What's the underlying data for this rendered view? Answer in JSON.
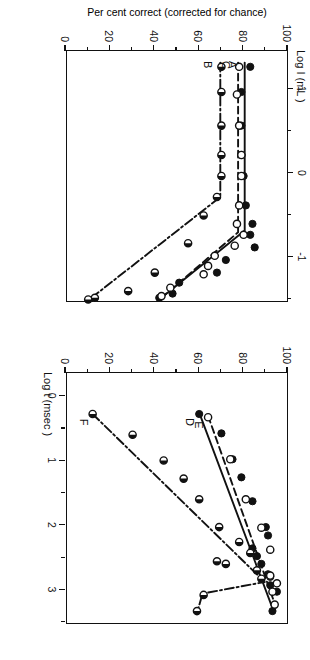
{
  "figure": {
    "type": "two-panel-line-scatter",
    "orientation": "rotated-90-clockwise",
    "y_axis_title": "Per cent correct (corrected for chance)",
    "left_panel_top_title": "Log I (mL )",
    "x_axis_title": "Log t (msec )"
  },
  "axes": {
    "y_ticks": [
      "100",
      "80",
      "60",
      "40",
      "20",
      "0"
    ],
    "y_values": [
      100,
      80,
      60,
      40,
      20,
      0
    ],
    "y_lim": [
      0,
      100
    ],
    "x_ticks_panel_left": [
      "1",
      "0",
      "-1"
    ],
    "x_values_panel_left": [
      1,
      0,
      -1
    ],
    "x_lim_panel_left": [
      1.45,
      -1.55
    ],
    "x_ticks_panel_right": [
      "0",
      "1",
      "2",
      "3"
    ],
    "x_values_panel_right": [
      0,
      1,
      2,
      3
    ],
    "x_lim_panel_right": [
      -0.35,
      3.55
    ]
  },
  "curve_labels": {
    "a": "A",
    "b": "B",
    "c": "C",
    "d": "D",
    "e": "E",
    "f": "F"
  },
  "chart_data": [
    {
      "type": "scatter",
      "id": "panel-left",
      "title": "",
      "xlabel": "Log I (mL )",
      "ylabel": "Per cent correct (corrected for chance)",
      "xlim": [
        1.45,
        -1.55
      ],
      "ylim": [
        0,
        100
      ],
      "grid": false,
      "legend": "inline-curve-labels",
      "series": [
        {
          "name": "A",
          "marker": "filled-circle",
          "line": "solid",
          "points": [
            [
              1.25,
              83
            ],
            [
              0.95,
              79
            ],
            [
              0.55,
              79
            ],
            [
              0.2,
              79
            ],
            [
              -0.05,
              80
            ],
            [
              -0.4,
              81
            ],
            [
              -0.62,
              84
            ],
            [
              -0.75,
              83
            ],
            [
              -0.9,
              85
            ],
            [
              -1.05,
              72
            ],
            [
              -1.2,
              68
            ],
            [
              -1.32,
              51
            ],
            [
              -1.45,
              48
            ],
            [
              -1.5,
              42
            ]
          ]
        },
        {
          "name": "C",
          "marker": "open-circle",
          "line": "dashed",
          "points": [
            [
              1.25,
              78
            ],
            [
              0.92,
              77
            ],
            [
              0.55,
              78
            ],
            [
              0.2,
              79
            ],
            [
              -0.05,
              79
            ],
            [
              -0.4,
              78
            ],
            [
              -0.62,
              77
            ],
            [
              -0.75,
              80
            ],
            [
              -0.88,
              76
            ],
            [
              -1.0,
              67
            ],
            [
              -1.12,
              64
            ],
            [
              -1.22,
              62
            ],
            [
              -1.38,
              47
            ],
            [
              -1.48,
              43
            ]
          ]
        },
        {
          "name": "B",
          "marker": "half-filled-circle",
          "line": "dash-dot",
          "points": [
            [
              1.25,
              70
            ],
            [
              0.95,
              70
            ],
            [
              0.55,
              70
            ],
            [
              0.2,
              70
            ],
            [
              -0.05,
              70
            ],
            [
              -0.3,
              68
            ],
            [
              -0.52,
              62
            ],
            [
              -0.85,
              55
            ],
            [
              -1.2,
              40
            ],
            [
              -1.42,
              28
            ],
            [
              -1.5,
              13
            ],
            [
              -1.52,
              10
            ]
          ]
        }
      ]
    },
    {
      "type": "scatter",
      "id": "panel-right",
      "title": "",
      "xlabel": "Log t (msec )",
      "ylabel": "Per cent correct (corrected for chance)",
      "xlim": [
        -0.35,
        3.55
      ],
      "ylim": [
        0,
        100
      ],
      "grid": false,
      "legend": "inline-curve-labels",
      "series": [
        {
          "name": "D",
          "marker": "filled-circle",
          "line": "solid",
          "points": [
            [
              3.35,
              93
            ],
            [
              3.05,
              95
            ],
            [
              2.95,
              92
            ],
            [
              2.82,
              92
            ],
            [
              2.78,
              91
            ],
            [
              2.62,
              88
            ],
            [
              2.5,
              86
            ],
            [
              2.38,
              84
            ],
            [
              2.18,
              91
            ],
            [
              2.05,
              90
            ],
            [
              1.65,
              84
            ],
            [
              1.28,
              79
            ],
            [
              1.0,
              75
            ],
            [
              0.6,
              70
            ],
            [
              0.3,
              60
            ]
          ]
        },
        {
          "name": "E",
          "marker": "open-circle",
          "line": "dashed",
          "points": [
            [
              3.25,
              94
            ],
            [
              3.05,
              93
            ],
            [
              2.92,
              95
            ],
            [
              2.8,
              92
            ],
            [
              2.4,
              92
            ],
            [
              2.06,
              88
            ],
            [
              1.62,
              81
            ],
            [
              1.0,
              74
            ],
            [
              0.35,
              64
            ]
          ]
        },
        {
          "name": "F",
          "marker": "half-filled-circle",
          "line": "dash-dot",
          "points": [
            [
              3.35,
              59
            ],
            [
              3.1,
              62
            ],
            [
              2.85,
              88
            ],
            [
              2.72,
              86
            ],
            [
              2.62,
              72
            ],
            [
              2.58,
              68
            ],
            [
              2.45,
              83
            ],
            [
              2.28,
              78
            ],
            [
              2.05,
              69
            ],
            [
              1.62,
              60
            ],
            [
              1.3,
              53
            ],
            [
              1.02,
              44
            ],
            [
              0.62,
              30
            ],
            [
              0.3,
              12
            ]
          ]
        }
      ]
    }
  ]
}
